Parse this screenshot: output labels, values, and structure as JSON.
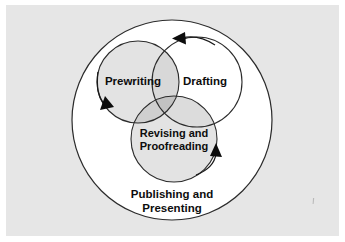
{
  "figure": {
    "background_color": "#e6e6e6",
    "page_color": "#ffffff",
    "ink_color": "#0d0d0d"
  },
  "diagram": {
    "type": "venn-cycle",
    "outer_circle": {
      "name": "publishing-presenting",
      "label_line1": "Publishing and",
      "label_line2": "Presenting",
      "cx": 172,
      "cy": 120,
      "r": 100,
      "fill": "#ffffff"
    },
    "stages": [
      {
        "name": "prewriting",
        "label": "Prewriting",
        "cx": 138,
        "cy": 82,
        "r": 41,
        "fill": "#e3e3e3",
        "label_x": 133,
        "label_y": 82
      },
      {
        "name": "drafting",
        "label": "Drafting",
        "cx": 197,
        "cy": 82,
        "r": 45,
        "fill": "#ffffff",
        "label_x": 204,
        "label_y": 82
      },
      {
        "name": "revising-proofreading",
        "label_line1": "Revising and",
        "label_line2": "Proofreading",
        "cx": 174,
        "cy": 139,
        "r": 43,
        "fill": "#e3e3e3",
        "label_x": 174,
        "label_y": 134
      }
    ],
    "overlap_fills": {
      "pair": "#d2d2d2",
      "triple": "#bdbdbd"
    },
    "arrows": [
      {
        "name": "arrow-to-drafting",
        "direction": "up-left",
        "tip_x": 176,
        "tip_y": 38
      },
      {
        "name": "arrow-to-revising",
        "direction": "up-right",
        "tip_x": 210,
        "tip_y": 148
      },
      {
        "name": "arrow-to-prewriting",
        "direction": "down-right",
        "tip_x": 110,
        "tip_y": 104
      }
    ]
  }
}
